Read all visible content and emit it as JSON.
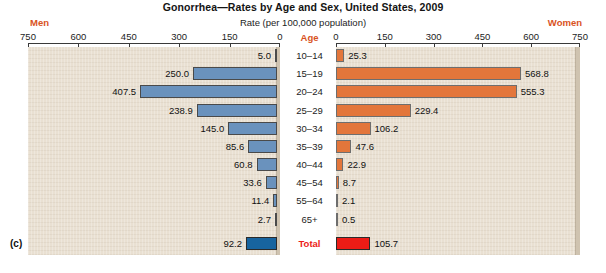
{
  "figure_label": "(c)",
  "header": {
    "title": "Gonorrhea—Rates by Age and Sex, United States, 2009",
    "subtitle": "Rate (per 100,000 population)",
    "left_label": "Men",
    "right_label": "Women",
    "age_header": "Age"
  },
  "colors": {
    "men_bar": "#6a92bd",
    "men_total_bar": "#17649f",
    "women_bar": "#e3763b",
    "women_total_bar": "#ec1c16",
    "accent_text": "#d9531e",
    "total_text": "#ec1c16",
    "panel_background": "#e9e0d2"
  },
  "axis": {
    "left_ticks": [
      "750",
      "600",
      "450",
      "300",
      "150",
      "0"
    ],
    "right_ticks": [
      "0",
      "150",
      "300",
      "450",
      "600",
      "750"
    ],
    "max": 750,
    "min": 0
  },
  "chart_data": {
    "type": "bar",
    "title": "Gonorrhea—Rates by Age and Sex, United States, 2009",
    "subtitle": "Rate (per 100,000 population)",
    "xlabel": "Rate (per 100,000 population)",
    "ylabel": "Age",
    "orientation": "horizontal",
    "layout": "back-to-back population pyramid",
    "xlim": [
      0,
      750
    ],
    "grid": false,
    "legend_position": "top (Men left, Women right)",
    "categories": [
      "10–14",
      "15–19",
      "20–24",
      "25–29",
      "30–34",
      "35–39",
      "40–44",
      "45–54",
      "55–64",
      "65+",
      "Total"
    ],
    "series": [
      {
        "name": "Men",
        "side": "left",
        "values": [
          5.0,
          250.0,
          407.5,
          238.9,
          145.0,
          85.6,
          60.8,
          33.6,
          11.4,
          2.7,
          92.2
        ],
        "labels": [
          "5.0",
          "250.0",
          "407.5",
          "238.9",
          "145.0",
          "85.6",
          "60.8",
          "33.6",
          "11.4",
          "2.7",
          "92.2"
        ]
      },
      {
        "name": "Women",
        "side": "right",
        "values": [
          25.3,
          568.8,
          555.3,
          229.4,
          106.2,
          47.6,
          22.9,
          8.7,
          2.1,
          0.5,
          105.7
        ],
        "labels": [
          "25.3",
          "568.8",
          "555.3",
          "229.4",
          "106.2",
          "47.6",
          "22.9",
          "8.7",
          "2.1",
          "0.5",
          "105.7"
        ]
      }
    ]
  }
}
